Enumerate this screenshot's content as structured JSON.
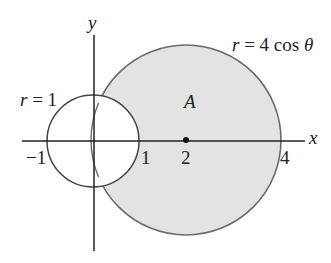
{
  "diagram": {
    "axes": {
      "x_label": "x",
      "y_label": "y"
    },
    "curves": [
      {
        "name": "small-circle",
        "equation_r": "r",
        "equation_rest": " = 1"
      },
      {
        "name": "big-circle",
        "equation_r": "r",
        "equation_rest": " = 4 cos ",
        "theta": "θ",
        "fill": "#e3e3e3"
      }
    ],
    "region_label": "A",
    "ticks": {
      "neg1": "−1",
      "one": "1",
      "two": "2",
      "four": "4"
    },
    "colors": {
      "stroke": "#555555",
      "axis": "#222222",
      "fill": "#e3e3e3"
    }
  }
}
